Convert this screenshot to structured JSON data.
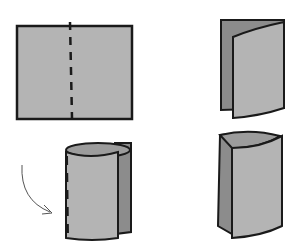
{
  "diagram": {
    "title": "",
    "steps": [
      {
        "id": 1,
        "shape": "flat-sheet-with-dashed-center-line",
        "position": "top-left"
      },
      {
        "id": 2,
        "shape": "sheet-folded-in-half",
        "position": "top-right"
      },
      {
        "id": 3,
        "shape": "sheet-rolled-into-cylinder",
        "position": "bottom-left",
        "annotation": "curved-arrow"
      },
      {
        "id": 4,
        "shape": "cylinder-opened",
        "position": "bottom-right"
      }
    ],
    "colors": {
      "paper_light": "#b4b4b4",
      "paper_dark": "#8c8c8c",
      "outline": "#1a1a1a",
      "background": "#ffffff"
    }
  }
}
